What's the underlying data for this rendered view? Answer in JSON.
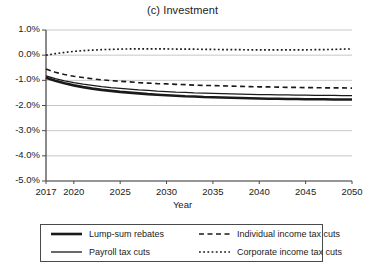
{
  "chart_data": {
    "type": "line",
    "title": "(c) Investment",
    "xlabel": "Year",
    "ylabel": "",
    "xlim": [
      2017,
      2050
    ],
    "ylim": [
      -5.0,
      1.0
    ],
    "yticks": [
      "1.0%",
      "0.0%",
      "-1.0%",
      "-2.0%",
      "-3.0%",
      "-4.0%",
      "-5.0%"
    ],
    "ytick_values": [
      1.0,
      0.0,
      -1.0,
      -2.0,
      -3.0,
      -4.0,
      -5.0
    ],
    "xticks": [
      "2017",
      "2020",
      "2025",
      "2030",
      "2035",
      "2040",
      "2045",
      "2050"
    ],
    "xtick_values": [
      2017,
      2020,
      2025,
      2030,
      2035,
      2040,
      2045,
      2050
    ],
    "grid": "horizontal",
    "legend_position": "below-plot",
    "units": "percent",
    "x": [
      2017,
      2018,
      2019,
      2020,
      2021,
      2022,
      2023,
      2024,
      2025,
      2026,
      2027,
      2028,
      2029,
      2030,
      2031,
      2032,
      2033,
      2034,
      2035,
      2036,
      2037,
      2038,
      2039,
      2040,
      2041,
      2042,
      2043,
      2044,
      2045,
      2046,
      2047,
      2048,
      2049,
      2050
    ],
    "series": [
      {
        "name": "Lump-sum rebates",
        "style": "solid",
        "width": "thick",
        "color": "#1a1a1a",
        "values": [
          -0.9,
          -1.02,
          -1.12,
          -1.2,
          -1.27,
          -1.33,
          -1.38,
          -1.42,
          -1.46,
          -1.49,
          -1.52,
          -1.55,
          -1.57,
          -1.59,
          -1.61,
          -1.63,
          -1.64,
          -1.66,
          -1.67,
          -1.68,
          -1.69,
          -1.7,
          -1.71,
          -1.72,
          -1.73,
          -1.73,
          -1.74,
          -1.74,
          -1.75,
          -1.75,
          -1.75,
          -1.76,
          -1.76,
          -1.76
        ]
      },
      {
        "name": "Payroll tax cuts",
        "style": "solid",
        "width": "thin",
        "color": "#1a1a1a",
        "values": [
          -0.82,
          -0.93,
          -1.02,
          -1.09,
          -1.15,
          -1.2,
          -1.25,
          -1.29,
          -1.32,
          -1.35,
          -1.38,
          -1.4,
          -1.43,
          -1.45,
          -1.47,
          -1.48,
          -1.5,
          -1.51,
          -1.52,
          -1.53,
          -1.54,
          -1.55,
          -1.56,
          -1.57,
          -1.57,
          -1.58,
          -1.58,
          -1.59,
          -1.59,
          -1.6,
          -1.6,
          -1.6,
          -1.61,
          -1.61
        ]
      },
      {
        "name": "Individual income tax cuts",
        "style": "dashed",
        "width": "medium",
        "color": "#1a1a1a",
        "values": [
          -0.55,
          -0.68,
          -0.77,
          -0.84,
          -0.89,
          -0.94,
          -0.98,
          -1.01,
          -1.04,
          -1.06,
          -1.09,
          -1.11,
          -1.13,
          -1.14,
          -1.16,
          -1.17,
          -1.19,
          -1.2,
          -1.21,
          -1.22,
          -1.23,
          -1.24,
          -1.25,
          -1.26,
          -1.26,
          -1.27,
          -1.28,
          -1.28,
          -1.29,
          -1.29,
          -1.3,
          -1.3,
          -1.3,
          -1.31
        ]
      },
      {
        "name": "Corporate income tax cuts",
        "style": "dotted",
        "width": "medium",
        "color": "#1a1a1a",
        "values": [
          0.0,
          0.06,
          0.11,
          0.15,
          0.18,
          0.2,
          0.22,
          0.23,
          0.24,
          0.25,
          0.25,
          0.25,
          0.25,
          0.25,
          0.24,
          0.24,
          0.24,
          0.23,
          0.23,
          0.22,
          0.22,
          0.22,
          0.21,
          0.21,
          0.21,
          0.21,
          0.21,
          0.21,
          0.21,
          0.22,
          0.22,
          0.23,
          0.24,
          0.25
        ]
      }
    ]
  },
  "legend": {
    "items": [
      {
        "label": "Lump-sum rebates"
      },
      {
        "label": "Individual income tax cuts"
      },
      {
        "label": "Payroll tax cuts"
      },
      {
        "label": "Corporate income tax cuts"
      }
    ]
  }
}
